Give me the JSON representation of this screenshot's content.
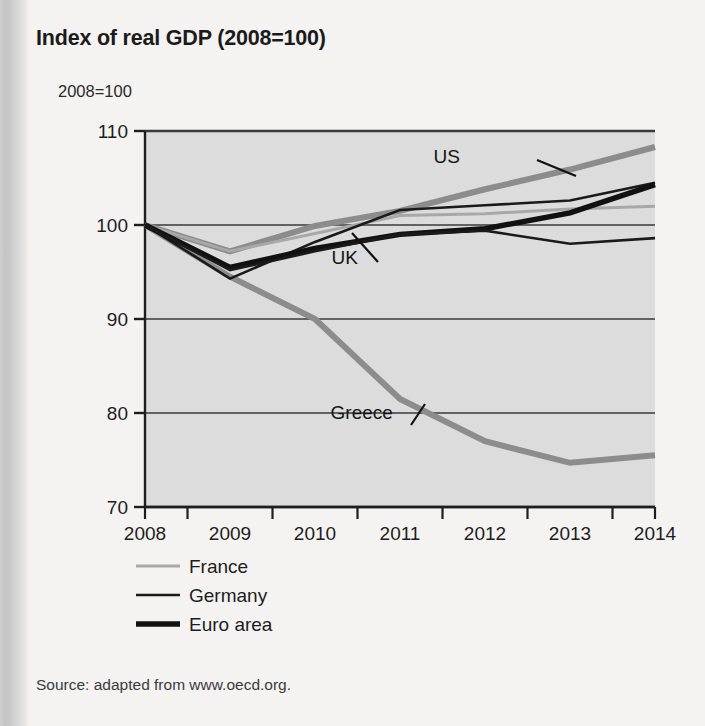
{
  "figure": {
    "title": "Index of real GDP (2008=100)",
    "y_axis_caption": "2008=100",
    "source_note": "Source: adapted from www.oecd.org."
  },
  "chart_data": {
    "type": "line",
    "title": "Index of real GDP (2008=100)",
    "xlabel": "",
    "ylabel": "2008=100",
    "x": [
      2008,
      2009,
      2010,
      2011,
      2012,
      2013,
      2014
    ],
    "xtick_labels": [
      "2008",
      "2009",
      "2010",
      "2011",
      "2012",
      "2013",
      "2014"
    ],
    "ytick_labels": [
      "70",
      "80",
      "90",
      "100",
      "110"
    ],
    "yticks": [
      70,
      80,
      90,
      100,
      110
    ],
    "ylim": [
      70,
      110
    ],
    "xlim": [
      2008,
      2014
    ],
    "grid": "horizontal",
    "legend_position": "below-left",
    "plot_background": "#dcdcdc",
    "series": [
      {
        "name": "US",
        "values": [
          100.0,
          97.2,
          99.9,
          101.5,
          103.8,
          105.9,
          108.3
        ],
        "color": "#8c8c8c",
        "width": 6.0,
        "labelled_on_plot": true,
        "in_legend": false
      },
      {
        "name": "Greece",
        "values": [
          100.0,
          94.5,
          90.0,
          81.5,
          77.0,
          74.7,
          75.5
        ],
        "color": "#8c8c8c",
        "width": 6.0,
        "labelled_on_plot": true,
        "in_legend": false
      },
      {
        "name": "France",
        "values": [
          100.0,
          97.2,
          99.1,
          101.0,
          101.2,
          101.7,
          102.0
        ],
        "color": "#a8a8a8",
        "width": 3.0,
        "labelled_on_plot": false,
        "in_legend": true
      },
      {
        "name": "Germany",
        "values": [
          100.0,
          94.3,
          98.2,
          101.6,
          102.1,
          102.6,
          104.5
        ],
        "color": "#1a1a1a",
        "width": 2.6,
        "labelled_on_plot": false,
        "in_legend": true
      },
      {
        "name": "Euro area",
        "values": [
          100.0,
          95.5,
          97.5,
          99.0,
          99.6,
          101.3,
          104.3
        ],
        "color": "#111111",
        "width": 5.4,
        "labelled_on_plot": false,
        "in_legend": true
      },
      {
        "name": "UK",
        "values": [
          100.0,
          95.2,
          97.2,
          99.0,
          99.4,
          98.0,
          98.6
        ],
        "color": "#1a1a1a",
        "width": 2.6,
        "labelled_on_plot": true,
        "in_legend": false
      }
    ],
    "annotations": [
      {
        "text": "US",
        "x": 2011.55,
        "y": 106.6
      },
      {
        "text": "UK",
        "x": 2010.35,
        "y": 95.9
      },
      {
        "text": "Greece",
        "x": 2010.55,
        "y": 79.4
      }
    ],
    "legend": [
      {
        "label": "France",
        "color": "#a8a8a8",
        "width": 3.0
      },
      {
        "label": "Germany",
        "color": "#1a1a1a",
        "width": 2.6
      },
      {
        "label": "Euro area",
        "color": "#111111",
        "width": 5.4
      }
    ]
  }
}
